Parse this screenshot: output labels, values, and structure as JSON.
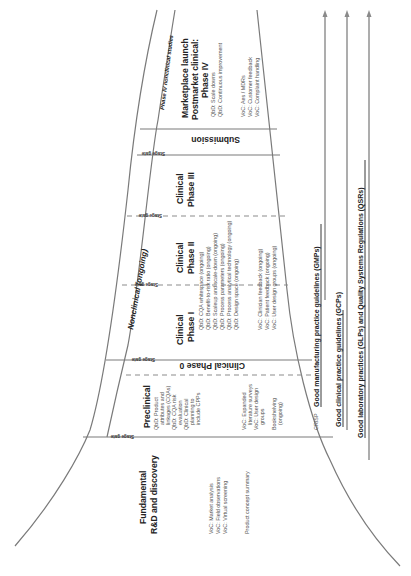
{
  "stages": {
    "fundamental": {
      "title_line1": "Fundamental",
      "title_line2": "R&D and discovery",
      "items": [
        "VoC: Market analysis",
        "VoC: Field observations",
        "VoC: Virtual screening",
        "",
        "Product concept summary"
      ]
    },
    "preclinical": {
      "title": "Preclinical",
      "qbd": [
        "QbD: Product",
        "attributes and",
        "linkages (CQAs)",
        "QbD: CQA risk",
        "evaluation",
        "QbD: Clinical",
        "planning to",
        "include CPPs"
      ],
      "voc": [
        "VoC: Expanded",
        "literature surveys",
        "VoC: User design",
        "groups"
      ],
      "other": [
        "Bookshelving",
        "(ongoing)",
        "",
        "CRISP"
      ]
    },
    "clinical_phase_0": {
      "title": "Clinical Phase 0"
    },
    "clinical_phase_1": {
      "title_line1": "Clinical",
      "title_line2": "Phase I"
    },
    "clinical_phase_2": {
      "title_line1": "Clinical",
      "title_line2": "Phase II",
      "qbd": [
        "QbD: CQA whitespace (ongoing)",
        "QbD: Benefit-to-risk ratio (ongoing)",
        "QbD: Scaleup and scale-down (ongoing)",
        "QbD: Process parameters (ongoing)",
        "QbD: Process analytical technology (ongoing)",
        "QbD: Design space (ongoing)"
      ],
      "voc": [
        "VoC: Clinician feedback (ongoing)",
        "VoC: Patient feedback (ongoing)",
        "VoC: User design groups (ongoing)"
      ]
    },
    "clinical_phase_3": {
      "title_line1": "Clinical",
      "title_line2": "Phase III"
    },
    "submission": {
      "title": "Submission"
    },
    "marketplace": {
      "title_line1": "Marketplace launch",
      "title_line2": "Postmarket clinical:",
      "title_line3": "Phase IV",
      "qbd": [
        "QbD: Scale downs",
        "QbD: Continuous improvement"
      ],
      "voc": [
        "VoC: Aes / MDRs",
        "VoC: Customer feedback",
        "VoC: Complaint handling"
      ]
    }
  },
  "bands": {
    "nonclinical": "Nonclinical (ongoing)",
    "phase4_nonclinical": "Phase IV nonclinical studies"
  },
  "stage_gate_label": "Stage gate",
  "regulations": {
    "gmp": "Good manufacturing practice guidelines (GMPs)",
    "gcp": "Good clinical practice guidelines (GCPs)",
    "glp_qsr": "Good laboratory practices (GLPs) and Quality Systems Regulations (QSRs)"
  },
  "colors": {
    "line": "#7a7a7a",
    "text": "#222222",
    "subtext": "#555555",
    "background": "#ffffff"
  }
}
